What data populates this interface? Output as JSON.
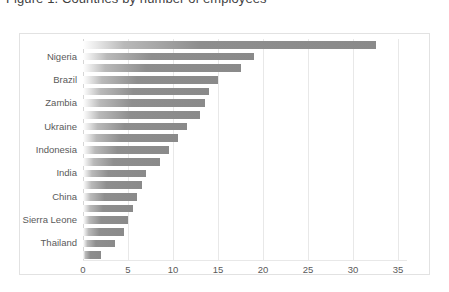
{
  "title": {
    "text": "Figure 1. Countries by number of employees",
    "clipped": true
  },
  "chart_data": {
    "type": "bar",
    "orientation": "horizontal",
    "title": "Figure 1. Countries by number of employees",
    "xlabel": "",
    "ylabel": "",
    "xlim": [
      0,
      35
    ],
    "xticks": [
      0,
      5,
      10,
      15,
      20,
      25,
      30,
      35
    ],
    "xtick_labels": [
      "0",
      "5",
      "10",
      "15",
      "20",
      "25",
      "30",
      "35"
    ],
    "grid": "vertical",
    "legend": "none",
    "bar_color": "#8c8c8c",
    "gridline_color": "#e8e8e8",
    "note": "19 bars in descending order; only every other bar carries a visible category label",
    "categories": [
      "",
      "Nigeria",
      "",
      "Brazil",
      "",
      "Zambia",
      "",
      "Ukraine",
      "",
      "Indonesia",
      "",
      "India",
      "",
      "China",
      "",
      "Sierra Leone",
      "",
      "Thailand",
      ""
    ],
    "visible_labels": [
      "Nigeria",
      "Brazil",
      "Zambia",
      "Ukraine",
      "Indonesia",
      "India",
      "China",
      "Sierra Leone",
      "Thailand"
    ],
    "values": [
      32.5,
      19.0,
      17.5,
      15.0,
      14.0,
      13.5,
      13.0,
      11.5,
      10.5,
      9.5,
      8.5,
      7.0,
      6.5,
      6.0,
      5.5,
      5.0,
      4.5,
      3.5,
      2.0
    ]
  }
}
